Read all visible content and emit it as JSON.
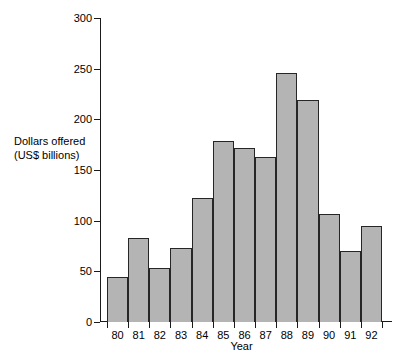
{
  "chart_data": {
    "type": "bar",
    "title": "",
    "xlabel": "Year",
    "ylabel": "Dollars offered (US$ billions)",
    "ylabel_lines": [
      "Dollars offered",
      "(US$ billions)"
    ],
    "categories": [
      "80",
      "81",
      "82",
      "83",
      "84",
      "85",
      "86",
      "87",
      "88",
      "89",
      "90",
      "91",
      "92"
    ],
    "values": [
      44,
      83,
      53,
      73,
      122,
      179,
      172,
      163,
      246,
      219,
      107,
      70,
      95
    ],
    "ylim": [
      0,
      300
    ],
    "yticks": [
      0,
      50,
      100,
      150,
      200,
      250,
      300
    ],
    "ytick_labels": [
      "0",
      "50",
      "100",
      "150",
      "200",
      "250",
      "300"
    ],
    "grid": false,
    "legend": false,
    "bar_style": "contiguous-histogram",
    "bar_fill_color": "#b4b4b4",
    "bar_edge_color": "#262626",
    "axis_color": "#1a1a1a",
    "background_color": "#ffffff"
  }
}
